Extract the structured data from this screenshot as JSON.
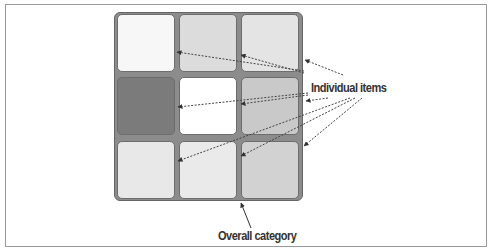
{
  "labels": {
    "individual_items": "Individual items",
    "overall_category": "Overall category"
  },
  "grid": {
    "rows": 3,
    "cols": 3,
    "cells": [
      {
        "row": 0,
        "col": 0,
        "shade": "#f7f7f7"
      },
      {
        "row": 0,
        "col": 1,
        "shade": "#dcdcdc"
      },
      {
        "row": 0,
        "col": 2,
        "shade": "#e4e4e4"
      },
      {
        "row": 1,
        "col": 0,
        "shade": "#7b7b7b"
      },
      {
        "row": 1,
        "col": 1,
        "shade": "#ffffff"
      },
      {
        "row": 1,
        "col": 2,
        "shade": "#c9c9c9"
      },
      {
        "row": 2,
        "col": 0,
        "shade": "#e8e8e8"
      },
      {
        "row": 2,
        "col": 1,
        "shade": "#eaeaea"
      },
      {
        "row": 2,
        "col": 2,
        "shade": "#d2d2d2"
      }
    ]
  },
  "colors": {
    "background": "#ffffff",
    "grid_gap": "#8c8c8c",
    "arrow": "#444444",
    "text": "#333333"
  }
}
